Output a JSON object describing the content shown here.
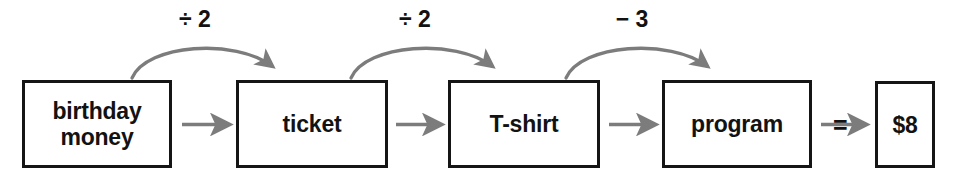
{
  "diagram": {
    "colors": {
      "box_border": "#151515",
      "text": "#121212",
      "arrow": "#7c7c7c",
      "background": "#ffffff"
    },
    "boxes": [
      {
        "id": "birthday-money",
        "label": "birthday\nmoney",
        "x": 22,
        "y": 80,
        "w": 150,
        "h": 88
      },
      {
        "id": "ticket",
        "label": "ticket",
        "x": 236,
        "y": 80,
        "w": 152,
        "h": 88
      },
      {
        "id": "tshirt",
        "label": "T-shirt",
        "x": 448,
        "y": 80,
        "w": 152,
        "h": 88
      },
      {
        "id": "program",
        "label": "program",
        "x": 662,
        "y": 80,
        "w": 150,
        "h": 88
      },
      {
        "id": "amount",
        "label": "$8",
        "x": 875,
        "y": 81,
        "w": 60,
        "h": 87
      }
    ],
    "operations": [
      {
        "id": "op-1",
        "label": "÷ 2",
        "from": "birthday-money",
        "to": "ticket",
        "x": 195,
        "y": 8
      },
      {
        "id": "op-2",
        "label": "÷ 2",
        "from": "ticket",
        "to": "tshirt",
        "x": 415,
        "y": 8
      },
      {
        "id": "op-3",
        "label": "− 3",
        "from": "tshirt",
        "to": "program",
        "x": 632,
        "y": 8
      }
    ],
    "equals_sign": {
      "label": "=",
      "x": 833,
      "y": 113
    },
    "flow_arrows": [
      {
        "id": "flow-1",
        "from": "birthday-money",
        "to": "ticket"
      },
      {
        "id": "flow-2",
        "from": "ticket",
        "to": "tshirt"
      },
      {
        "id": "flow-3",
        "from": "tshirt",
        "to": "program"
      },
      {
        "id": "flow-4",
        "from": "program",
        "to": "amount"
      }
    ]
  }
}
